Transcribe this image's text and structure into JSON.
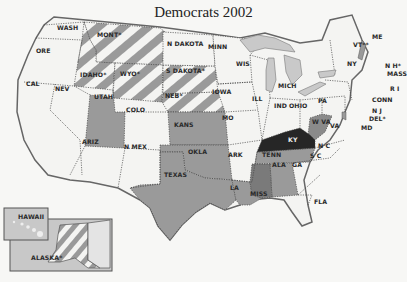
{
  "title": "Democrats 2002",
  "colors": {
    "background": "#f7f7f5",
    "none": "#f4f4f2",
    "medium": "#9a9a9a",
    "dark_medium": "#7a7a7a",
    "dark": "#262626",
    "stripe_dark": "#9a9a9a",
    "stripe_light": "#f4f4f2",
    "lakes": "#c9c9c9"
  },
  "legend_categories": [
    "unshaded",
    "medium gray",
    "dark gray",
    "black",
    "striped"
  ],
  "states": {
    "wash": "WASH",
    "ore": "ORE",
    "cal": "CAL",
    "nev": "NEV",
    "idaho": "IDAHO*",
    "mont": "MONT*",
    "wyo": "WYO*",
    "utah": "UTAH",
    "colo": "COLO",
    "ariz": "ARIZ",
    "nmex": "N MEX",
    "ndakota": "N DAKOTA",
    "sdakota": "S DAKOTA*",
    "neb": "NEB*",
    "kans": "KANS",
    "okla": "OKLA",
    "texas": "TEXAS",
    "minn": "MINN",
    "iowa": "IOWA",
    "mo": "MO",
    "ark": "ARK",
    "la": "LA",
    "wis": "WIS",
    "ill": "ILL",
    "mich": "MICH",
    "ind": "IND",
    "ohio": "OHIO",
    "ky": "KY",
    "tenn": "TENN",
    "miss": "MISS",
    "ala": "ALA",
    "ga": "GA",
    "fla": "FLA",
    "sc": "S C",
    "nc": "N C",
    "va": "VA",
    "wva": "W VA",
    "pa": "PA",
    "ny": "NY",
    "vt": "VT**",
    "me": "ME",
    "nh": "N H*",
    "mass": "MASS",
    "ri": "R I",
    "conn": "CONN",
    "nj": "N J",
    "del": "DEL*",
    "md": "MD",
    "hawaii": "HAWAII",
    "alaska": "ALASKA*"
  },
  "shading": {
    "striped": [
      "MONT*",
      "IDAHO*",
      "WYO*",
      "S DAKOTA*",
      "NEB*",
      "ALASKA*"
    ],
    "medium": [
      "UTAH",
      "KANS",
      "OKLA",
      "TEXAS",
      "LA",
      "TENN",
      "ALA",
      "W VA"
    ],
    "dark_medium": [
      "MISS"
    ],
    "dark": [
      "KY"
    ],
    "unshaded": [
      "WASH",
      "ORE",
      "CAL",
      "NEV",
      "ARIZ",
      "N MEX",
      "COLO",
      "N DAKOTA",
      "MINN",
      "IOWA",
      "MO",
      "ARK",
      "WIS",
      "ILL",
      "MICH",
      "IND",
      "OHIO",
      "GA",
      "FLA",
      "S C",
      "N C",
      "VA",
      "PA",
      "NY",
      "ME",
      "HAWAII"
    ]
  }
}
